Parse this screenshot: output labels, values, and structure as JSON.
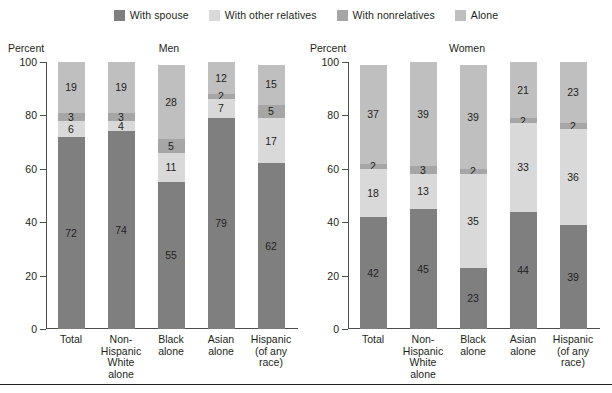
{
  "legend": {
    "items": [
      {
        "label": "With spouse",
        "color": "#7f7f7f",
        "icon": "legend-swatch-icon"
      },
      {
        "label": "With other relatives",
        "color": "#d9d9d9",
        "icon": "legend-swatch-icon"
      },
      {
        "label": "With nonrelatives",
        "color": "#a6a6a6",
        "icon": "legend-swatch-icon"
      },
      {
        "label": "Alone",
        "color": "#bfbfbf",
        "icon": "legend-swatch-icon"
      }
    ]
  },
  "axis": {
    "label": "Percent",
    "ticks": [
      "100",
      "80",
      "60",
      "40",
      "20",
      "0"
    ],
    "min": 0,
    "max": 100
  },
  "panels": [
    {
      "title": "Men"
    },
    {
      "title": "Women"
    }
  ],
  "categories": [
    "Total",
    "Non-\nHispanic\nWhite alone",
    "Black\nalone",
    "Asian\nalone",
    "Hispanic\n(of any\nrace)"
  ],
  "chart_data": {
    "type": "bar",
    "title": "",
    "subtitle": "",
    "xlabel": "",
    "ylabel": "Percent",
    "ylim": [
      0,
      100
    ],
    "grid": false,
    "stacked": true,
    "stack_order_bottom_to_top": [
      "With spouse",
      "With other relatives",
      "With nonrelatives",
      "Alone"
    ],
    "legend_position": "top-center",
    "categories": [
      "Total",
      "Non-Hispanic White alone",
      "Black alone",
      "Asian alone",
      "Hispanic (of any race)"
    ],
    "panels": [
      {
        "name": "Men",
        "series": [
          {
            "name": "With spouse",
            "color": "#7f7f7f",
            "values": [
              72,
              74,
              55,
              79,
              62
            ]
          },
          {
            "name": "With other relatives",
            "color": "#d9d9d9",
            "values": [
              6,
              4,
              11,
              7,
              17
            ]
          },
          {
            "name": "With nonrelatives",
            "color": "#a6a6a6",
            "values": [
              3,
              3,
              5,
              2,
              5
            ]
          },
          {
            "name": "Alone",
            "color": "#bfbfbf",
            "values": [
              19,
              19,
              28,
              12,
              15
            ]
          }
        ]
      },
      {
        "name": "Women",
        "series": [
          {
            "name": "With spouse",
            "color": "#7f7f7f",
            "values": [
              42,
              45,
              23,
              44,
              39
            ]
          },
          {
            "name": "With other relatives",
            "color": "#d9d9d9",
            "values": [
              18,
              13,
              35,
              33,
              36
            ]
          },
          {
            "name": "With nonrelatives",
            "color": "#a6a6a6",
            "values": [
              2,
              3,
              2,
              2,
              2
            ]
          },
          {
            "name": "Alone",
            "color": "#bfbfbf",
            "values": [
              37,
              39,
              39,
              21,
              23
            ]
          }
        ]
      }
    ]
  }
}
